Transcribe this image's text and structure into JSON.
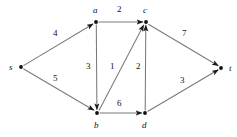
{
  "figure": {
    "name": "weighted-directed-graph",
    "background": "#ffffff",
    "edge_color": "#7a7a7a",
    "node_color": "#101010",
    "label_color": "#101010"
  },
  "nodes": [
    {
      "id": "s",
      "label": "s",
      "x": 21,
      "y": 67,
      "label_x": 9,
      "label_y": 63
    },
    {
      "id": "a",
      "label": "a",
      "x": 96,
      "y": 22,
      "label_x": 93,
      "label_y": 6
    },
    {
      "id": "c",
      "label": "c",
      "x": 146,
      "y": 22,
      "label_x": 143,
      "label_y": 6
    },
    {
      "id": "b",
      "label": "b",
      "x": 97,
      "y": 113,
      "label_x": 94,
      "label_y": 121
    },
    {
      "id": "d",
      "label": "d",
      "x": 145,
      "y": 113,
      "label_x": 142,
      "label_y": 121
    },
    {
      "id": "t",
      "label": "t",
      "x": 221,
      "y": 68,
      "label_x": 229,
      "label_y": 64
    }
  ],
  "edges": [
    {
      "id": "s-a",
      "from": "s",
      "to": "a",
      "weight": "4",
      "label_x": 53,
      "label_y": 29
    },
    {
      "id": "s-b",
      "from": "s",
      "to": "b",
      "weight": "5",
      "label_x": 53,
      "label_y": 74
    },
    {
      "id": "a-c",
      "from": "a",
      "to": "c",
      "weight": "2",
      "label_x": 117,
      "label_y": 5
    },
    {
      "id": "a-b",
      "from": "a",
      "to": "b",
      "weight": "3",
      "label_x": 86,
      "label_y": 62
    },
    {
      "id": "b-c",
      "from": "b",
      "to": "c",
      "weight": "1",
      "label_x": 110,
      "label_y": 62
    },
    {
      "id": "b-d",
      "from": "b",
      "to": "d",
      "weight": "6",
      "label_x": 117,
      "label_y": 99
    },
    {
      "id": "d-c",
      "from": "d",
      "to": "c",
      "weight": "2",
      "label_x": 136,
      "label_y": 62
    },
    {
      "id": "c-t",
      "from": "c",
      "to": "t",
      "weight": "7",
      "label_x": 182,
      "label_y": 29
    },
    {
      "id": "d-t",
      "from": "d",
      "to": "t",
      "weight": "3",
      "label_x": 180,
      "label_y": 76
    }
  ]
}
